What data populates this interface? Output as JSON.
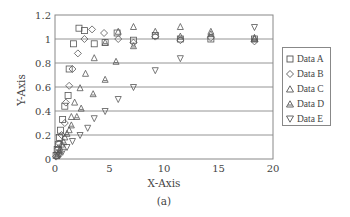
{
  "chart_data": {
    "type": "scatter",
    "title": "",
    "caption": "(a)",
    "xlabel": "X-Axis",
    "ylabel": "Y-Axis",
    "xlim": [
      0,
      20
    ],
    "ylim": [
      0,
      1.2
    ],
    "xticks": [
      0,
      5,
      10,
      15,
      20
    ],
    "yticks": [
      0,
      0.2,
      0.4,
      0.6,
      0.8,
      1,
      1.2
    ],
    "xtick_labels": [
      "0",
      "5",
      "10",
      "15",
      "20"
    ],
    "ytick_labels": [
      "0",
      "0.2",
      "0.4",
      "0.6",
      "0.8",
      "1",
      "1.2"
    ],
    "grid": "horizontal",
    "legend_position": "right",
    "series": [
      {
        "name": "Data A",
        "marker": "square",
        "points": [
          [
            0.1,
            0.03
          ],
          [
            0.2,
            0.08
          ],
          [
            0.3,
            0.12
          ],
          [
            0.4,
            0.18
          ],
          [
            0.5,
            0.24
          ],
          [
            0.7,
            0.33
          ],
          [
            0.9,
            0.44
          ],
          [
            1.2,
            0.53
          ],
          [
            1.3,
            0.75
          ],
          [
            1.7,
            0.96
          ],
          [
            2.2,
            1.09
          ],
          [
            2.7,
            1.07
          ],
          [
            3.6,
            0.96
          ],
          [
            4.6,
            0.97
          ],
          [
            5.7,
            1.05
          ],
          [
            7.2,
            0.99
          ],
          [
            9.2,
            1.03
          ],
          [
            11.5,
            1.0
          ],
          [
            14.3,
            1.0
          ],
          [
            18.3,
            1.0
          ]
        ]
      },
      {
        "name": "Data B",
        "marker": "diamond",
        "points": [
          [
            0.1,
            0.02
          ],
          [
            0.2,
            0.05
          ],
          [
            0.3,
            0.09
          ],
          [
            0.4,
            0.13
          ],
          [
            0.6,
            0.2
          ],
          [
            0.9,
            0.3
          ],
          [
            1.0,
            0.47
          ],
          [
            1.3,
            0.61
          ],
          [
            1.6,
            0.75
          ],
          [
            2.1,
            0.88
          ],
          [
            2.7,
            1.0
          ],
          [
            3.4,
            1.08
          ],
          [
            4.5,
            1.05
          ],
          [
            5.8,
            1.0
          ],
          [
            7.2,
            0.97
          ],
          [
            9.2,
            1.02
          ],
          [
            11.5,
            0.99
          ],
          [
            14.3,
            1.01
          ],
          [
            18.3,
            0.98
          ]
        ]
      },
      {
        "name": "Data C",
        "marker": "triangle-up",
        "points": [
          [
            0.2,
            0.03
          ],
          [
            0.4,
            0.07
          ],
          [
            0.6,
            0.12
          ],
          [
            0.9,
            0.18
          ],
          [
            1.3,
            0.24
          ],
          [
            1.5,
            0.35
          ],
          [
            1.8,
            0.47
          ],
          [
            2.3,
            0.59
          ],
          [
            2.8,
            0.71
          ],
          [
            3.6,
            0.84
          ],
          [
            5.8,
            1.06
          ],
          [
            7.2,
            1.1
          ],
          [
            9.2,
            1.06
          ],
          [
            11.5,
            1.1
          ],
          [
            14.3,
            1.06
          ],
          [
            18.3,
            1.01
          ]
        ]
      },
      {
        "name": "Data D",
        "marker": "triangle-up-dot",
        "points": [
          [
            0.3,
            0.04
          ],
          [
            0.5,
            0.08
          ],
          [
            0.8,
            0.14
          ],
          [
            1.1,
            0.21
          ],
          [
            1.5,
            0.28
          ],
          [
            2.0,
            0.35
          ],
          [
            2.4,
            0.42
          ],
          [
            3.5,
            0.54
          ],
          [
            4.6,
            0.66
          ],
          [
            5.6,
            0.81
          ],
          [
            7.2,
            0.94
          ],
          [
            4.6,
            0.97
          ],
          [
            11.5,
            1.02
          ],
          [
            14.3,
            1.04
          ],
          [
            18.3,
            1.0
          ]
        ]
      },
      {
        "name": "Data E",
        "marker": "triangle-down",
        "points": [
          [
            0.4,
            0.03
          ],
          [
            0.7,
            0.06
          ],
          [
            1.1,
            0.1
          ],
          [
            1.6,
            0.15
          ],
          [
            2.3,
            0.2
          ],
          [
            3.0,
            0.26
          ],
          [
            3.6,
            0.34
          ],
          [
            4.6,
            0.4
          ],
          [
            5.8,
            0.5
          ],
          [
            7.2,
            0.6
          ],
          [
            9.2,
            0.74
          ],
          [
            11.5,
            0.84
          ],
          [
            18.3,
            1.1
          ]
        ]
      }
    ]
  },
  "legend": {
    "items": [
      {
        "label": "Data A"
      },
      {
        "label": "Data B"
      },
      {
        "label": "Data C"
      },
      {
        "label": "Data D"
      },
      {
        "label": "Data E"
      }
    ]
  },
  "axes": {
    "xlabel": "X-Axis",
    "ylabel": "Y-Axis",
    "caption": "(a)"
  },
  "colors": {
    "marker_stroke": "#555555",
    "grid": "#7a7a7a",
    "axis": "#888888"
  }
}
